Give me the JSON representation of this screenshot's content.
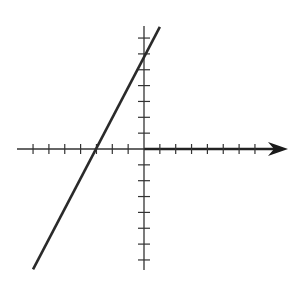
{
  "chart_data": {
    "type": "line",
    "title": "",
    "xlabel": "",
    "ylabel": "",
    "x_ticks": [
      -7,
      -6,
      -5,
      -4,
      -3,
      -2,
      -1,
      1,
      2,
      3,
      4,
      5,
      6,
      7
    ],
    "y_ticks": [
      -7,
      -6,
      -5,
      -4,
      -3,
      -2,
      -1,
      1,
      2,
      3,
      4,
      5,
      6,
      7
    ],
    "tick_labels_shown": false,
    "xlim": [
      -7.5,
      9
    ],
    "ylim": [
      -7.7,
      7.7
    ],
    "grid": false,
    "legend": null,
    "x_axis_arrow": true,
    "series": [
      {
        "name": "line",
        "equation": "y = 2x + 6",
        "slope": 2,
        "y_intercept": 6,
        "x_intercept": -3,
        "x": [
          -7,
          1
        ],
        "y": [
          -7.6,
          7.7
        ]
      }
    ]
  },
  "layout": {
    "origin_px": [
      144,
      149
    ],
    "unit_px": 15.85,
    "x_axis_px": [
      17,
      288
    ],
    "y_axis_px": [
      26,
      270
    ],
    "line_px": [
      [
        32,
        269
      ],
      [
        160,
        26
      ]
    ],
    "colors": {
      "axis": "#333333",
      "line": "#2a2a2a",
      "background": "#ffffff"
    }
  }
}
